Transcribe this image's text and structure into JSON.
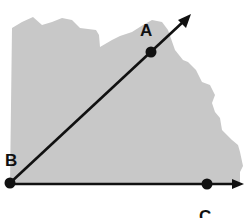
{
  "diagram": {
    "type": "angle",
    "colors": {
      "background": "#ffffff",
      "shading": "#c8c8c8",
      "stroke": "#111111"
    },
    "vertex": {
      "label": "B",
      "x": 10,
      "y": 183
    },
    "points": [
      {
        "label": "A",
        "x": 151,
        "y": 52,
        "label_x": 140,
        "label_y": 36
      },
      {
        "label": "B",
        "x": 10,
        "y": 183,
        "label_x": 6,
        "label_y": 165
      },
      {
        "label": "C",
        "x": 207,
        "y": 184,
        "label_x": 200,
        "label_y": 217
      }
    ],
    "rays": [
      {
        "name": "ray-BA",
        "from": "B",
        "through": "A",
        "tip_x": 190,
        "tip_y": 15
      },
      {
        "name": "ray-BC",
        "from": "B",
        "through": "C",
        "tip_x": 243,
        "tip_y": 184
      }
    ]
  }
}
